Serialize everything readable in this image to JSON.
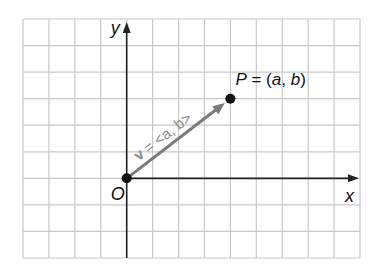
{
  "diagram": {
    "type": "coordinate-plane-vector",
    "grid": {
      "columns": 13,
      "rows": 9,
      "origin_col": 4,
      "origin_row": 6,
      "line_color": "#c8c8c8",
      "axis_color": "#222222"
    },
    "axes": {
      "x_label": "x",
      "y_label": "y",
      "origin_label": "O"
    },
    "point": {
      "name": "P",
      "label": "P = (a, b)",
      "grid_x": 4,
      "grid_y": 3
    },
    "vector": {
      "label": "v = <a, b>",
      "bold_part": "v",
      "rest_part": " = <a, b>",
      "from": [
        0,
        0
      ],
      "to": [
        4,
        3
      ],
      "color": "#7a7a7a"
    }
  }
}
